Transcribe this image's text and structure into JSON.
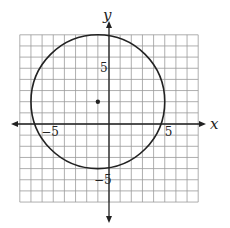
{
  "chart_data": {
    "type": "scatter",
    "title": "",
    "xlabel": "x",
    "ylabel": "y",
    "xlim": [
      -8,
      8
    ],
    "ylim": [
      -7,
      8
    ],
    "grid": true,
    "x_tick_labels": [
      {
        "value": -5,
        "label": "−5"
      },
      {
        "value": 5,
        "label": "5"
      }
    ],
    "y_tick_labels": [
      {
        "value": 5,
        "label": "5"
      },
      {
        "value": -5,
        "label": "−5"
      }
    ],
    "circle": {
      "center": [
        -1,
        2
      ],
      "radius": 6
    },
    "points": [
      {
        "x": -1,
        "y": 2,
        "label": "center"
      }
    ],
    "colors": {
      "grid": "#9a9a9a",
      "axis": "#222222",
      "curve": "#222222"
    }
  }
}
